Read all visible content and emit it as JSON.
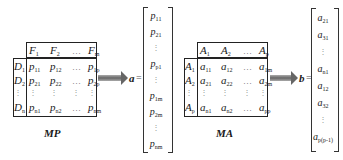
{
  "mp_matrix": {
    "caption": "MP",
    "col_headers": [
      "F",
      "F",
      "…",
      "F"
    ],
    "col_header_subs": [
      "1",
      "2",
      "",
      "m"
    ],
    "row_headers": [
      "D",
      "D",
      "⋮",
      "D"
    ],
    "row_header_subs": [
      "1",
      "2",
      "",
      "n"
    ],
    "rows": [
      [
        [
          "p",
          "11"
        ],
        [
          "p",
          "12"
        ],
        [
          "…",
          ""
        ],
        [
          "p",
          "1p"
        ]
      ],
      [
        [
          "p",
          "21"
        ],
        [
          "p",
          "22"
        ],
        [
          "…",
          ""
        ],
        [
          "p",
          "2p"
        ]
      ],
      [
        [
          "⋮",
          ""
        ],
        [
          "⋮",
          ""
        ],
        [
          "⋮",
          ""
        ],
        [
          "⋮",
          ""
        ]
      ],
      [
        [
          "p",
          "n1"
        ],
        [
          "p",
          "n2"
        ],
        [
          "…",
          ""
        ],
        [
          "p",
          "nm"
        ]
      ]
    ]
  },
  "vector_a": {
    "label": "a",
    "equals": "=",
    "entries": [
      [
        "p",
        "11"
      ],
      [
        "p",
        "21"
      ],
      [
        "⋮",
        ""
      ],
      [
        "p",
        "p1"
      ],
      [
        "⋮",
        ""
      ],
      [
        "p",
        "1m"
      ],
      [
        "p",
        "2m"
      ],
      [
        "⋮",
        ""
      ],
      [
        "p",
        "nm"
      ]
    ]
  },
  "ma_matrix": {
    "caption": "MA",
    "col_headers": [
      "A",
      "A",
      "…",
      "A"
    ],
    "col_header_subs": [
      "1",
      "2",
      "",
      "p"
    ],
    "row_headers": [
      "A",
      "A",
      "⋮",
      "A"
    ],
    "row_header_subs": [
      "1",
      "2",
      "",
      "p"
    ],
    "rows": [
      [
        [
          "a",
          "11"
        ],
        [
          "a",
          "12"
        ],
        [
          "…",
          ""
        ],
        [
          "a",
          "1m"
        ]
      ],
      [
        [
          "a",
          "21"
        ],
        [
          "a",
          "22"
        ],
        [
          "…",
          ""
        ],
        [
          "a",
          "2m"
        ]
      ],
      [
        [
          "⋮",
          ""
        ],
        [
          "⋮",
          ""
        ],
        [
          "⋮",
          ""
        ],
        [
          "⋮",
          ""
        ]
      ],
      [
        [
          "a",
          "n1"
        ],
        [
          "a",
          "n2"
        ],
        [
          "…",
          ""
        ],
        [
          "a",
          "pp"
        ]
      ]
    ]
  },
  "vector_b": {
    "label": "b",
    "equals": "=",
    "entries": [
      [
        "a",
        "21"
      ],
      [
        "a",
        "31"
      ],
      [
        "⋮",
        ""
      ],
      [
        "a",
        "n1"
      ],
      [
        "a",
        "12"
      ],
      [
        "a",
        "32"
      ],
      [
        "⋮",
        ""
      ],
      [
        "a",
        "p(p-1)"
      ]
    ]
  },
  "colors": {
    "line": "#222222",
    "arrow": "#777777",
    "text": "#1a1a1a"
  }
}
